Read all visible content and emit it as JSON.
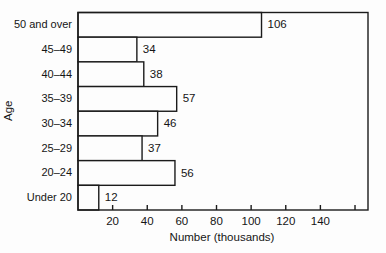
{
  "chart_data": {
    "type": "bar",
    "orientation": "horizontal",
    "title": "",
    "xlabel": "Number (thousands)",
    "ylabel": "Age",
    "categories": [
      "50 and over",
      "45–49",
      "40–44",
      "35–39",
      "30–34",
      "25–29",
      "20–24",
      "Under 20"
    ],
    "values": [
      106,
      34,
      38,
      57,
      46,
      37,
      56,
      12
    ],
    "value_labels": [
      "106",
      "34",
      "38",
      "57",
      "46",
      "37",
      "56",
      "12"
    ],
    "xlim": [
      0,
      167.5
    ],
    "xticks": [
      20,
      40,
      60,
      80,
      100,
      120,
      140,
      160
    ],
    "xtick_labels": [
      "20",
      "40",
      "60",
      "80",
      "100",
      "120",
      "140",
      ""
    ],
    "grid": false,
    "legend": "none",
    "bar_fill": "#fdfdfd",
    "line_color": "#1b1b1b",
    "text_color": "#151515",
    "frame": true,
    "value_labels_shown": true
  }
}
